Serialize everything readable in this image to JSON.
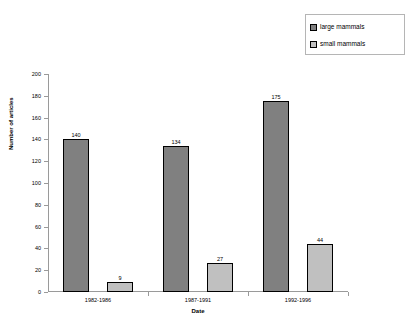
{
  "chart_data": {
    "type": "bar",
    "title": "",
    "categories": [
      "1982-1986",
      "1987-1991",
      "1992-1996"
    ],
    "series": [
      {
        "name": "large mammals",
        "values": [
          140,
          134,
          175
        ],
        "color": "#808080"
      },
      {
        "name": "small mammals",
        "values": [
          9,
          27,
          44
        ],
        "color": "#c0c0c0"
      }
    ],
    "xlabel": "Date",
    "ylabel": "Number of articles",
    "ylim": [
      0,
      200
    ],
    "ytick_step": 20,
    "yticks": [
      0,
      20,
      40,
      60,
      80,
      100,
      120,
      140,
      160,
      180,
      200
    ],
    "grid": false,
    "legend_position": "top-right",
    "show_value_labels": true
  },
  "legend": {
    "entries": [
      {
        "label": "large mammals",
        "swatch": "#808080"
      },
      {
        "label": "small mammals",
        "swatch": "#c0c0c0"
      }
    ]
  }
}
